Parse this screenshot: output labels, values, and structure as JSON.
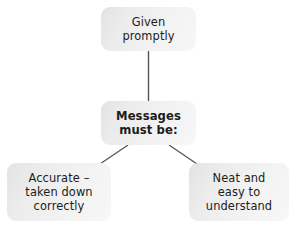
{
  "diagram": {
    "type": "flowchart",
    "title": "Messages must be:",
    "background_color": "#ffffff",
    "node_fill_color": "#eeeeee",
    "text_color": "#1c1c1c",
    "connector_color": "#5a5a5a",
    "nodes": [
      {
        "id": "given-promptly",
        "label": "Given\npromptly",
        "emphasis": false
      },
      {
        "id": "messages-must-be",
        "label": "Messages\nmust be:",
        "emphasis": true
      },
      {
        "id": "accurate",
        "label": "Accurate –\ntaken down\ncorrectly",
        "emphasis": false
      },
      {
        "id": "neat",
        "label": "Neat and\neasy to\nunderstand",
        "emphasis": false
      }
    ],
    "connectors": [
      {
        "id": "given-to-messages",
        "from": "given-promptly",
        "to": "messages-must-be",
        "style": "vertical-line"
      },
      {
        "id": "messages-to-accurate",
        "from": "messages-must-be",
        "to": "accurate",
        "style": "diagonal-line"
      },
      {
        "id": "messages-to-neat",
        "from": "messages-must-be",
        "to": "neat",
        "style": "diagonal-line"
      }
    ]
  }
}
